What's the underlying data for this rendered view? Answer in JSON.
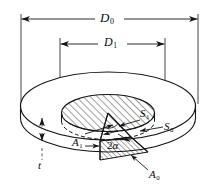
{
  "figure": {
    "kind": "engineering-diagram",
    "background_color": "#ffffff",
    "line_color": "#141414",
    "hatch_color": "#2a2a2a"
  },
  "dimensions": {
    "outer_diameter": {
      "symbol": "D",
      "subscript": "0"
    },
    "inner_diameter": {
      "symbol": "D",
      "subscript": "1"
    },
    "thickness": {
      "symbol": "t",
      "subscript": ""
    }
  },
  "surfaces": {
    "outer_surface": {
      "symbol": "S",
      "subscript": "0"
    },
    "inner_surface": {
      "symbol": "S",
      "subscript": "1"
    }
  },
  "areas": {
    "outer_area": {
      "symbol": "A",
      "subscript": "0"
    },
    "inner_area": {
      "symbol": "A",
      "subscript": "1"
    }
  },
  "angle": {
    "label": "2",
    "symbol": "α",
    "full": "2α"
  }
}
